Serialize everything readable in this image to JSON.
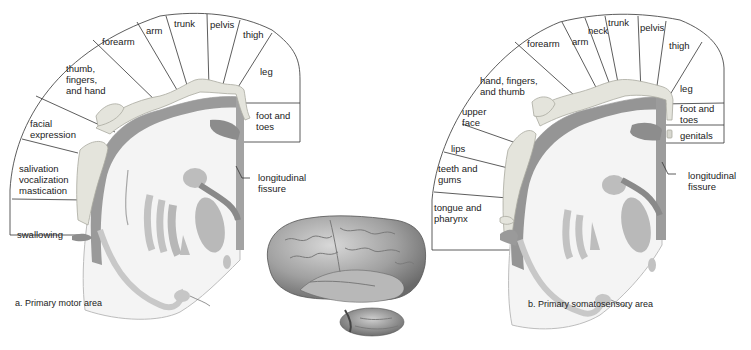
{
  "figure": {
    "panel_a": {
      "caption": "a. Primary motor area",
      "regions": [
        {
          "id": "swallowing",
          "label": "swallowing"
        },
        {
          "id": "salivation",
          "label_lines": [
            "salivation",
            "vocalization",
            "mastication"
          ]
        },
        {
          "id": "facial-expression",
          "label_lines": [
            "facial",
            "expression"
          ]
        },
        {
          "id": "thumb-fingers-hand",
          "label_lines": [
            "thumb,",
            "fingers,",
            "and hand"
          ]
        },
        {
          "id": "forearm",
          "label": "forearm"
        },
        {
          "id": "arm",
          "label": "arm"
        },
        {
          "id": "trunk",
          "label": "trunk"
        },
        {
          "id": "pelvis",
          "label": "pelvis"
        },
        {
          "id": "thigh",
          "label": "thigh"
        },
        {
          "id": "leg",
          "label": "leg"
        },
        {
          "id": "foot-toes",
          "label_lines": [
            "foot and",
            "toes"
          ]
        }
      ],
      "fissure_label_lines": [
        "longitudinal",
        "fissure"
      ]
    },
    "panel_b": {
      "caption": "b. Primary somatosensory area",
      "regions": [
        {
          "id": "tongue-pharynx",
          "label_lines": [
            "tongue and",
            "pharynx"
          ]
        },
        {
          "id": "teeth-gums",
          "label_lines": [
            "teeth and",
            "gums"
          ]
        },
        {
          "id": "lips",
          "label": "lips"
        },
        {
          "id": "upper-face",
          "label_lines": [
            "upper",
            "face"
          ]
        },
        {
          "id": "hand-fingers-thumb",
          "label_lines": [
            "hand, fingers,",
            "and thumb"
          ]
        },
        {
          "id": "forearm",
          "label": "forearm"
        },
        {
          "id": "arm",
          "label": "arm"
        },
        {
          "id": "neck",
          "label": "neck"
        },
        {
          "id": "trunk",
          "label": "trunk"
        },
        {
          "id": "pelvis",
          "label": "pelvis"
        },
        {
          "id": "thigh",
          "label": "thigh"
        },
        {
          "id": "leg",
          "label": "leg"
        },
        {
          "id": "foot-toes",
          "label_lines": [
            "foot and",
            "toes"
          ]
        },
        {
          "id": "genitals",
          "label": "genitals"
        }
      ],
      "fissure_label_lines": [
        "longitudinal",
        "fissure"
      ]
    },
    "colors": {
      "line": "#333333",
      "gray_matter": "#9a9a9a",
      "gray_light": "#c4c4c4",
      "white_matter": "#f4f4f4",
      "homunculus": "#e6e6df",
      "brain": "#a8a8a8"
    }
  }
}
